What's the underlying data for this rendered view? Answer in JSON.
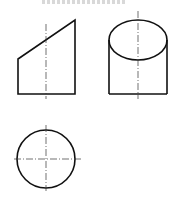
{
  "figure": {
    "caption_fragment": "",
    "stroke_color": "#111111",
    "centerline_color": "#333333",
    "views": {
      "front_view": {
        "label": "front view (truncated prism)",
        "points": "18,59 75,20 75,94 18,94",
        "centerline": {
          "x": 46,
          "y1": 24,
          "y2": 99
        }
      },
      "side_view": {
        "label": "side view (cylinder with oblique cut)",
        "ellipse": {
          "cx": 138,
          "cy": 40,
          "rx": 29,
          "ry": 20
        },
        "left_x": 109,
        "right_x": 167,
        "top_y": 40,
        "bottom_y": 94,
        "centerline": {
          "x": 138,
          "y1": 11,
          "y2": 99
        }
      },
      "top_view": {
        "label": "top view (circle)",
        "circle": {
          "cx": 46,
          "cy": 159,
          "r": 29
        },
        "h_centerline": {
          "x1": 14,
          "x2": 82,
          "y": 159
        },
        "v_centerline": {
          "x": 46,
          "y1": 125,
          "y2": 191
        }
      }
    }
  }
}
